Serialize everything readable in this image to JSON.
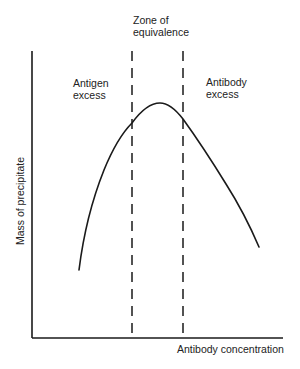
{
  "diagram": {
    "regions": {
      "zone_of_equivalence": "Zone of\nequivalence",
      "antigen_excess": "Antigen\nexcess",
      "antibody_excess": "Antibody\nexcess"
    },
    "axes": {
      "x_label": "Antibody concentration",
      "y_label": "Mass of precipitate"
    },
    "colors": {
      "line": "#1a1a1a",
      "background": "#ffffff",
      "text": "#222222"
    }
  }
}
